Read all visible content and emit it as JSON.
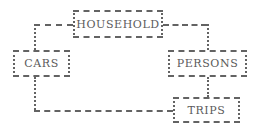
{
  "diagram": {
    "line_color": "#636363",
    "text_color": "#5b5b5b",
    "background": "#ffffff",
    "entities": [
      {
        "id": "household",
        "label": "HOUSEHOLD",
        "x": 73,
        "y": 10,
        "width": 90,
        "height": 28,
        "font_size": 11
      },
      {
        "id": "cars",
        "label": "CARS",
        "x": 13,
        "y": 50,
        "width": 57,
        "height": 27,
        "font_size": 11
      },
      {
        "id": "persons",
        "label": "PERSONS",
        "x": 168,
        "y": 50,
        "width": 79,
        "height": 27,
        "font_size": 11
      },
      {
        "id": "trips",
        "label": "TRIPS",
        "x": 173,
        "y": 97,
        "width": 67,
        "height": 26,
        "font_size": 11
      }
    ],
    "connections": [
      {
        "id": "household-cars-horizontal",
        "from": "household",
        "to": "cars",
        "orientation": "horizontal",
        "x": 34,
        "y": 24,
        "length": 39
      },
      {
        "id": "household-cars-vertical",
        "from": "household",
        "to": "cars",
        "orientation": "vertical",
        "x": 34,
        "y": 24,
        "length": 26
      },
      {
        "id": "household-persons-horizontal",
        "from": "household",
        "to": "persons",
        "orientation": "horizontal",
        "x": 163,
        "y": 24,
        "length": 44
      },
      {
        "id": "household-persons-vertical",
        "from": "household",
        "to": "persons",
        "orientation": "vertical",
        "x": 207,
        "y": 24,
        "length": 26
      },
      {
        "id": "persons-trips-vertical",
        "from": "persons",
        "to": "trips",
        "orientation": "vertical",
        "x": 207,
        "y": 77,
        "length": 20
      },
      {
        "id": "cars-trips-vertical",
        "from": "cars",
        "to": "trips",
        "orientation": "vertical",
        "x": 34,
        "y": 77,
        "length": 33
      },
      {
        "id": "cars-trips-horizontal",
        "from": "cars",
        "to": "trips",
        "orientation": "horizontal",
        "x": 34,
        "y": 110,
        "length": 139
      }
    ]
  }
}
